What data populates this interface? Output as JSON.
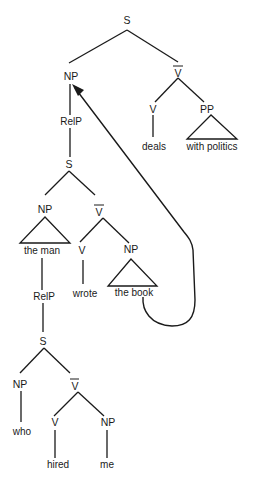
{
  "diagram": {
    "type": "syntax-tree",
    "nodes": {
      "root_s": "S",
      "np_main": "NP",
      "vbar_main": "V",
      "v_main": "V",
      "pp_main": "PP",
      "deals": "deals",
      "with_politics": "with politics",
      "relp_1": "RelP",
      "s_1": "S",
      "np_1": "NP",
      "the_man": "the man",
      "vbar_1": "V",
      "v_1": "V",
      "wrote": "wrote",
      "np_obj_1": "NP",
      "the_book": "the book",
      "relp_2": "RelP",
      "s_2": "S",
      "np_2": "NP",
      "who": "who",
      "vbar_2": "V",
      "v_2": "V",
      "hired": "hired",
      "np_obj_2": "NP",
      "me": "me"
    },
    "arrow": {
      "from": "the book",
      "to": "NP (main subject)"
    }
  }
}
